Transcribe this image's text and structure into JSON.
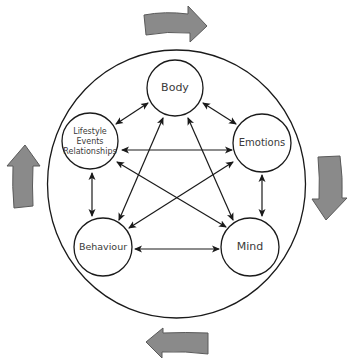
{
  "diagram": {
    "type": "five-areas-model",
    "colors": {
      "line": "#1a1a1a",
      "flow_arrow_fill": "#8a8a8a",
      "flow_arrow_stroke": "#5a5a5a",
      "text": "#3a3a3a",
      "background": "#ffffff"
    },
    "nodes": {
      "body": {
        "label": "Body"
      },
      "emotions": {
        "label": "Emotions"
      },
      "mind": {
        "label": "Mind"
      },
      "behaviour": {
        "label": "Behaviour"
      },
      "lifestyle": {
        "lines": [
          "Lifestyle",
          "Events",
          "Relationships"
        ]
      }
    },
    "connections": [
      {
        "from": "Body",
        "to": "Lifestyle Events Relationships",
        "direction": "bidirectional"
      },
      {
        "from": "Body",
        "to": "Emotions",
        "direction": "bidirectional"
      },
      {
        "from": "Body",
        "to": "Behaviour",
        "direction": "bidirectional"
      },
      {
        "from": "Body",
        "to": "Mind",
        "direction": "bidirectional"
      },
      {
        "from": "Lifestyle Events Relationships",
        "to": "Emotions",
        "direction": "bidirectional"
      },
      {
        "from": "Lifestyle Events Relationships",
        "to": "Behaviour",
        "direction": "bidirectional"
      },
      {
        "from": "Lifestyle Events Relationships",
        "to": "Mind",
        "direction": "bidirectional"
      },
      {
        "from": "Emotions",
        "to": "Behaviour",
        "direction": "bidirectional"
      },
      {
        "from": "Emotions",
        "to": "Mind",
        "direction": "bidirectional"
      },
      {
        "from": "Behaviour",
        "to": "Mind",
        "direction": "bidirectional"
      }
    ],
    "outer_flow": {
      "direction": "clockwise",
      "arrows": [
        "top-right",
        "right-down",
        "bottom-left",
        "left-up"
      ]
    }
  }
}
